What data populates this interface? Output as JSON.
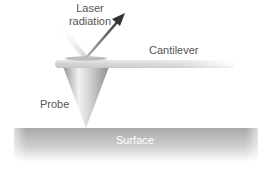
{
  "diagram": {
    "type": "Atomic force microscope principle",
    "labels": {
      "laser": [
        "Laser",
        "radiation"
      ],
      "cantilever": "Cantilever",
      "probe": "Probe",
      "surface": "Surface"
    },
    "colors": {
      "surface_top": "#a8a8a8",
      "surface_bottom": "#f4f4f4",
      "cantilever": "#d6d6d6",
      "probe_light": "#efefef",
      "probe_dark": "#9a9a9a",
      "arrow": "#444444",
      "label_text": "#555555",
      "surface_text": "#ffffff"
    }
  }
}
